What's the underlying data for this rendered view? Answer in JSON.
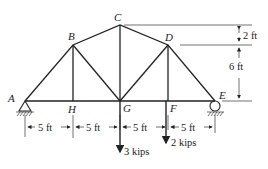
{
  "diagram": {
    "type": "truss",
    "joints": [
      {
        "id": "A",
        "label": "A"
      },
      {
        "id": "B",
        "label": "B"
      },
      {
        "id": "C",
        "label": "C"
      },
      {
        "id": "D",
        "label": "D"
      },
      {
        "id": "E",
        "label": "E"
      },
      {
        "id": "F",
        "label": "F"
      },
      {
        "id": "G",
        "label": "G"
      },
      {
        "id": "H",
        "label": "H"
      }
    ],
    "members": [
      "AB",
      "BC",
      "CD",
      "DE",
      "AH",
      "HG",
      "GF",
      "FE",
      "BH",
      "BG",
      "CG",
      "DG",
      "DF"
    ],
    "supports": {
      "A": "pin",
      "E": "roller"
    },
    "dimensions": {
      "horizontal": [
        "5 ft",
        "5 ft",
        "5 ft",
        "5 ft"
      ],
      "vertical_top": "2 ft",
      "vertical_bottom": "6 ft"
    },
    "loads": [
      {
        "joint": "G",
        "label": "3 kips"
      },
      {
        "joint": "F",
        "label": "2 kips"
      }
    ]
  }
}
